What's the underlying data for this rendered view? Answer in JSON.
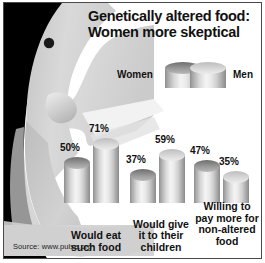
{
  "title": {
    "line1": "Genetically altered food:",
    "line2": "Women more skeptical"
  },
  "legend": {
    "women_label": "Women",
    "men_label": "Men"
  },
  "source": "Source: www.pulse.org",
  "colors": {
    "women_bar": "#6e6e6e",
    "men_bar": "#d8d8d8",
    "face_light": "#d5d5d5",
    "face_dark": "#000000",
    "border": "#4a4a4a",
    "text": "#111111",
    "background": "#ffffff"
  },
  "chart_data": {
    "type": "bar",
    "title": "Genetically altered food: Women more skeptical",
    "xlabel": "",
    "ylabel": "",
    "ylim": [
      0,
      100
    ],
    "grid": false,
    "legend_position": "top",
    "value_suffix": "%",
    "categories": [
      "Would eat such food",
      "Would give it to their children",
      "Willing to pay more for non-altered food"
    ],
    "category_lines": [
      [
        "Would eat",
        "such food"
      ],
      [
        "Would give",
        "it to their",
        "children"
      ],
      [
        "Willing to",
        "pay more for",
        "non-altered",
        "food"
      ]
    ],
    "series": [
      {
        "name": "Women",
        "values": [
          50,
          37,
          47
        ],
        "labels": [
          "50%",
          "37%",
          "47%"
        ]
      },
      {
        "name": "Men",
        "values": [
          71,
          59,
          35
        ],
        "labels": [
          "71%",
          "59%",
          "35%"
        ]
      }
    ],
    "source": "Source: www.pulse.org"
  }
}
